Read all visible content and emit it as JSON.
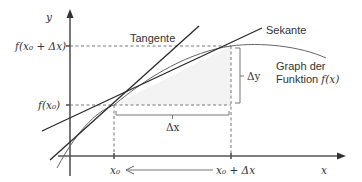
{
  "diagram": {
    "type": "difference quotient / secant vs tangent illustration",
    "labels": {
      "y_axis": "y",
      "x_axis": "x",
      "f_x0_dx": "f(x₀ + Δx)",
      "f_x0": "f(x₀)",
      "x0": "x₀",
      "x0_dx": "x₀ + Δx",
      "delta_x": "Δx",
      "delta_y": "Δy",
      "tangent": "Tangente",
      "secant": "Sekante",
      "graph_line1": "Graph der",
      "graph_line2_text": "Funktion ",
      "graph_line2_math": "f(x)"
    },
    "arrow_direction_note": "arrow pointing from x₀ + Δx toward x₀",
    "colors": {
      "axis": "#555555",
      "lines": "#2a2a2a",
      "curve": "#666666",
      "shade": "#f3f3f3",
      "text": "#333333"
    }
  }
}
